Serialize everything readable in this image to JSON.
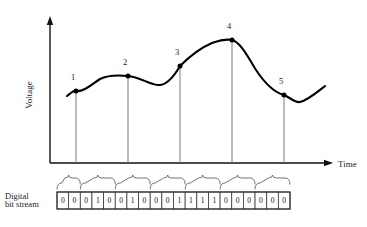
{
  "figure": {
    "axes": {
      "y_label": "Voltage",
      "x_label": "Time",
      "origin": {
        "x": 50,
        "y": 163
      },
      "x_end": 330,
      "y_top": 18
    },
    "curve": {
      "color": "#000000",
      "path": "M 67,96 C 72,92 74,90 76,91 C 84,92 92,84 100,79 C 108,75 118,75 128,76 C 140,77 148,84 158,85 C 166,86 173,78 180,66 C 190,56 200,48 212,43 C 221,40 227,39 232,40 C 240,42 247,55 256,70 C 266,85 276,93 284,95 C 291,98 295,103 300,102 C 308,100 316,93 325,86"
    },
    "samples": [
      {
        "id": "1",
        "label": "1",
        "x": 76,
        "y": 91,
        "label_x": 73,
        "label_y": 80
      },
      {
        "id": "2",
        "label": "2",
        "x": 128,
        "y": 76,
        "label_x": 125,
        "label_y": 65
      },
      {
        "id": "3",
        "label": "3",
        "x": 180,
        "y": 66,
        "label_x": 177,
        "label_y": 55
      },
      {
        "id": "4",
        "label": "4",
        "x": 232,
        "y": 40,
        "label_x": 229,
        "label_y": 29
      },
      {
        "id": "5",
        "label": "5",
        "x": 284,
        "y": 95,
        "label_x": 281,
        "label_y": 84
      }
    ],
    "bit_stream": {
      "label_line_1": "Digital",
      "label_line_2": "bit stream",
      "start_x": 57,
      "top_y": 192,
      "cell_width": 11.65,
      "cell_height": 17,
      "bits": [
        "0",
        "0",
        "0",
        "1",
        "0",
        "0",
        "1",
        "0",
        "0",
        "0",
        "1",
        "1",
        "1",
        "1",
        "0",
        "0",
        "0",
        "0",
        "0",
        "0"
      ]
    },
    "braces": [
      {
        "start_bit": 0,
        "end_bit": 2
      },
      {
        "start_bit": 2,
        "end_bit": 5
      },
      {
        "start_bit": 5,
        "end_bit": 8
      },
      {
        "start_bit": 8,
        "end_bit": 11
      },
      {
        "start_bit": 11,
        "end_bit": 14
      },
      {
        "start_bit": 14,
        "end_bit": 17
      },
      {
        "start_bit": 17,
        "end_bit": 20
      }
    ]
  }
}
